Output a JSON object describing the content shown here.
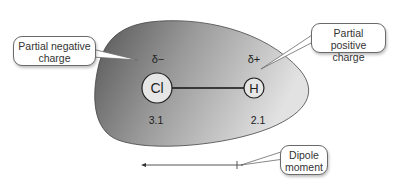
{
  "molecule": {
    "atoms": [
      {
        "symbol": "Cl",
        "partial_charge": "δ−",
        "electronegativity": "3.1"
      },
      {
        "symbol": "H",
        "partial_charge": "δ+",
        "electronegativity": "2.1"
      }
    ]
  },
  "callouts": {
    "negative": {
      "line1": "Partial negative",
      "line2": "charge"
    },
    "positive": {
      "line1": "Partial positive",
      "line2": "charge"
    },
    "dipole": {
      "line1": "Dipole",
      "line2": "moment"
    }
  },
  "colors": {
    "cloud_dark": "#5a5a5a",
    "cloud_light": "#d8d8d8",
    "atom_fill": "#e6e6e6",
    "outline": "#333333",
    "callout_border": "#6a6a6a"
  }
}
